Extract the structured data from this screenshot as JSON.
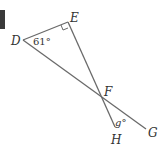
{
  "diagram": {
    "points": {
      "D": {
        "label": "D",
        "x": 23,
        "y": 40
      },
      "E": {
        "label": "E",
        "x": 68,
        "y": 22
      },
      "F": {
        "label": "F",
        "x": 101,
        "y": 96
      },
      "G": {
        "label": "G",
        "x": 146,
        "y": 129
      },
      "H": {
        "label": "H",
        "x": 115,
        "y": 127
      }
    },
    "angles": {
      "D": "61°",
      "E": "right-angle",
      "g": "g°"
    },
    "line_color": "#6a6a6a"
  }
}
